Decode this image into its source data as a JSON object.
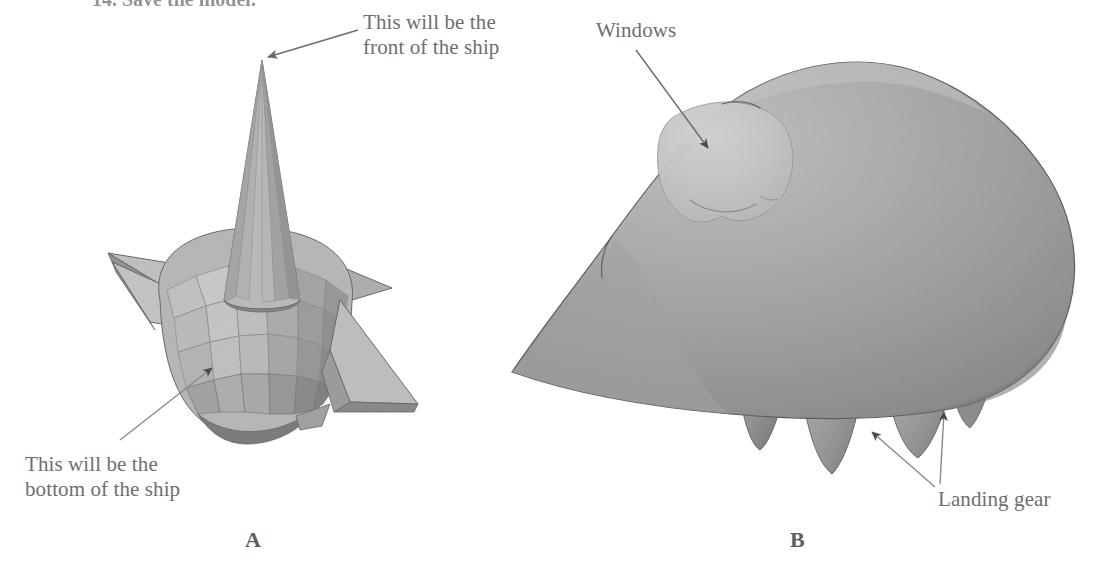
{
  "figure": {
    "title_fragment": "14. Save the model.",
    "panels": [
      {
        "id": "A",
        "letter": "A",
        "caption_letter": "A"
      },
      {
        "id": "B",
        "letter": "B",
        "caption_letter": "B"
      }
    ]
  },
  "annotations": {
    "front_of_ship": "This will be the\nfront of the ship",
    "bottom_of_ship": "This will be the\nbottom of the ship",
    "windows": "Windows",
    "landing_gear": "Landing gear"
  },
  "labels": {
    "panel_a": "A",
    "panel_b": "B"
  },
  "colors": {
    "background": "#ffffff",
    "text_gray": "#6e6e70",
    "letter_gray": "#5e5e60",
    "leader_line": "#8a8a8c",
    "arrowhead_dark": "#4a4a4c",
    "facet_light": "#cccccc",
    "facet_mid": "#b4b4b4",
    "facet_dark": "#9a9a9a",
    "facet_darkest": "#868686",
    "body_light": "#b8b8b8",
    "body_mid": "#a3a3a3",
    "body_dark": "#8d8d8d",
    "windows_highlight": "#c9c9c9",
    "outline": "#5f5f5f"
  }
}
